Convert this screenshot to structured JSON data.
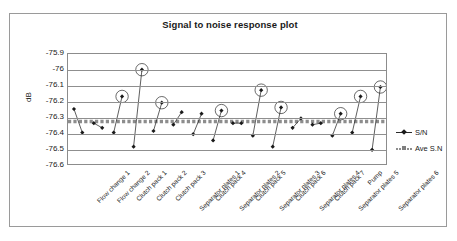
{
  "chart_data": {
    "type": "scatter",
    "title": "Signal to noise response plot",
    "xlabel": "",
    "ylabel": "dB",
    "ylim": [
      -76.6,
      -75.9
    ],
    "yticks": [
      -75.9,
      -76,
      -76.1,
      -76.2,
      -76.3,
      -76.4,
      -76.5,
      -76.6
    ],
    "ytick_labels": [
      "-75.9",
      "-76",
      "-76.1",
      "-76.2",
      "-76.3",
      "-76.4",
      "-76.5",
      "-76.6"
    ],
    "grid": true,
    "legend_position": "right",
    "categories": [
      "Flow change 1",
      "Flow change 2",
      "Clutch pack 1",
      "Clutch pack 2",
      "Clutch pack 3",
      "Separator plates 1",
      "Clutch pack 4",
      "Separator plates 2",
      "Clutch pack 5",
      "Separator plates 3",
      "Clutch pack 6",
      "Separator plates 4",
      "Clutch pack 7",
      "Separator plates 5",
      "Pump",
      "Separator plates 6"
    ],
    "series": [
      {
        "name": "S/N",
        "color": "#1a1a1a",
        "marker": "diamond",
        "description": "Paired level-1 / level-2 S/N values per factor, joined by a line",
        "level_1": [
          -76.25,
          -76.34,
          -76.4,
          -76.49,
          -76.39,
          -76.35,
          -76.41,
          -76.45,
          -76.34,
          -76.42,
          -76.49,
          -76.37,
          -76.35,
          -76.42,
          -76.4,
          -76.51
        ],
        "level_2": [
          -76.4,
          -76.37,
          -76.17,
          -76.0,
          -76.21,
          -76.27,
          -76.28,
          -76.26,
          -76.34,
          -76.13,
          -76.24,
          -76.31,
          -76.34,
          -76.28,
          -76.17,
          -76.11
        ]
      },
      {
        "name": "Ave S.N",
        "color": "#8d8d8d",
        "marker": "square",
        "description": "Constant average reference line",
        "value": -76.33
      }
    ],
    "highlighted_points": [
      {
        "category": "Clutch pack 1",
        "value": -76.17
      },
      {
        "category": "Clutch pack 2",
        "value": -76.0
      },
      {
        "category": "Clutch pack 3",
        "value": -76.21
      },
      {
        "category": "Separator plates 2",
        "value": -76.26
      },
      {
        "category": "Separator plates 3",
        "value": -76.13
      },
      {
        "category": "Clutch pack 6",
        "value": -76.24
      },
      {
        "category": "Separator plates 5",
        "value": -76.28
      },
      {
        "category": "Pump",
        "value": -76.17
      },
      {
        "category": "Separator plates 6",
        "value": -76.11
      }
    ]
  },
  "legend": {
    "items": [
      {
        "label": "S/N"
      },
      {
        "label": "Ave S.N"
      }
    ]
  }
}
